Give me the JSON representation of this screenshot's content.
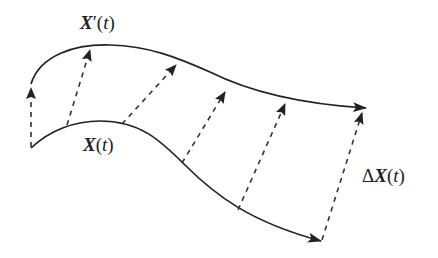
{
  "diagram": {
    "type": "curve-displacement",
    "background": "#ffffff",
    "stroke_color": "#222222",
    "curves": [
      {
        "id": "x-prime",
        "label": "X'(t)",
        "path": "M31,84 C40,55 75,44 110,45 C150,46 178,58 210,72 C250,92 300,104 366,108"
      },
      {
        "id": "x",
        "label": "X(t)",
        "path": "M31,148 C50,130 75,121 100,121 C140,121 160,140 185,165 C215,195 250,222 321,241"
      }
    ],
    "displacement_vectors": [
      {
        "from": [
          31,
          147
        ],
        "to": [
          31,
          88
        ]
      },
      {
        "from": [
          67,
          125
        ],
        "to": [
          90,
          50
        ]
      },
      {
        "from": [
          122,
          124
        ],
        "to": [
          176,
          65
        ]
      },
      {
        "from": [
          182,
          163
        ],
        "to": [
          225,
          92
        ]
      },
      {
        "from": [
          238,
          210
        ],
        "to": [
          285,
          104
        ]
      },
      {
        "from": [
          322,
          240
        ],
        "to": [
          362,
          113
        ]
      }
    ],
    "labels": {
      "x_prime": {
        "var": "X",
        "prime": "′",
        "open": "(",
        "arg": "t",
        "close": ")"
      },
      "x": {
        "var": "X",
        "open": "(",
        "arg": "t",
        "close": ")"
      },
      "delta_x": {
        "delta": "Δ",
        "var": "X",
        "open": "(",
        "arg": "t",
        "close": ")"
      }
    }
  }
}
